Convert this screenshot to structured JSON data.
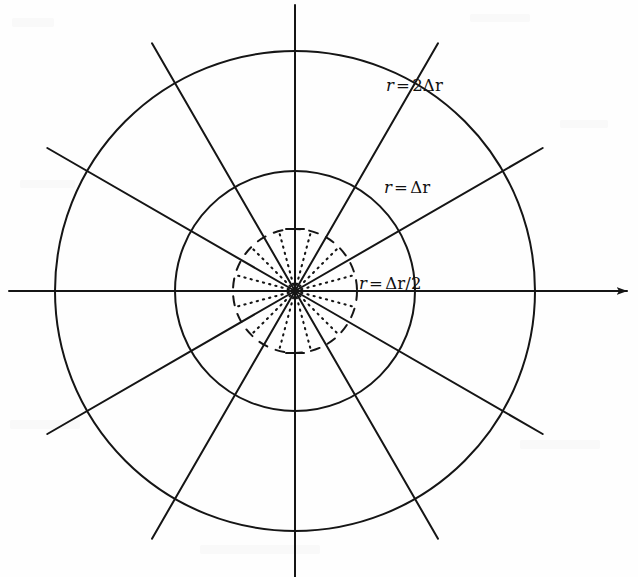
{
  "figure": {
    "kind": "polar-grid-diagram",
    "background_color": "#fefefe",
    "line_color": "#151515",
    "width": 638,
    "height": 577,
    "center": {
      "x": 295,
      "y": 291
    },
    "circles": [
      {
        "name": "outer-circle",
        "radius": 240,
        "style": "solid",
        "label_ref": "outer"
      },
      {
        "name": "inner-circle",
        "radius": 120,
        "style": "solid",
        "label_ref": "middle"
      },
      {
        "name": "half-step-circle",
        "radius": 62,
        "style": "dashed",
        "label_ref": "inner"
      }
    ],
    "spokes": {
      "name": "solid-spokes",
      "count": 12,
      "angle_step_deg": 30,
      "start_angle_deg": 0,
      "style": "solid",
      "length": 286
    },
    "dotted_rays": {
      "name": "dotted-rays",
      "count": 12,
      "angle_step_deg": 30,
      "start_angle_deg": 15,
      "style": "dotted",
      "length": 62
    },
    "axis": {
      "name": "horizontal-axis-arrow",
      "from_x": 55,
      "to_x": 628,
      "y": 291,
      "arrowhead": true
    }
  },
  "labels": {
    "outer": {
      "var": "r",
      "op": "=",
      "value": "2Δr",
      "text": "r = 2Δr"
    },
    "middle": {
      "var": "r",
      "op": "=",
      "value": "Δr",
      "text": "r = Δr"
    },
    "inner": {
      "var": "r",
      "op": "=",
      "value": "Δr/2",
      "text": "r = Δr/2"
    }
  },
  "chart_data": {
    "type": "scatter",
    "title": "",
    "xlabel": "",
    "ylabel": "",
    "annotations": [
      "r = 2Δr",
      "r = Δr",
      "r = Δr/2"
    ],
    "radii": [
      0.5,
      1,
      2
    ],
    "radii_labels": [
      "r = Δr/2",
      "r = Δr",
      "r = 2Δr"
    ],
    "angular_divisions": 12,
    "angular_step_deg": 30,
    "subdivision_rays_deg": 15,
    "grid": true,
    "legend": "none"
  }
}
